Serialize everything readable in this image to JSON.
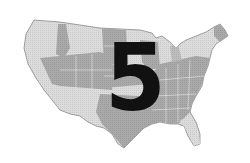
{
  "figure": {
    "overlay_number": "5",
    "colors": {
      "background": "#ffffff",
      "light_region": "#dcdcdc",
      "dark_region": "#a9a9a9",
      "outline": "#8a8a8a",
      "numeral": "#111111"
    }
  }
}
